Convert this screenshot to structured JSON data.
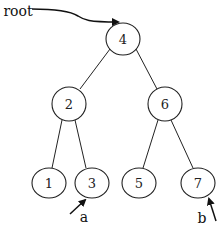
{
  "diagram": {
    "type": "binary-search-tree",
    "nodes": [
      {
        "id": "n4",
        "label": "4"
      },
      {
        "id": "n2",
        "label": "2"
      },
      {
        "id": "n6",
        "label": "6"
      },
      {
        "id": "n1",
        "label": "1"
      },
      {
        "id": "n3",
        "label": "3"
      },
      {
        "id": "n5",
        "label": "5"
      },
      {
        "id": "n7",
        "label": "7"
      }
    ],
    "edges": [
      {
        "from": "n4",
        "to": "n2"
      },
      {
        "from": "n4",
        "to": "n6"
      },
      {
        "from": "n2",
        "to": "n1"
      },
      {
        "from": "n2",
        "to": "n3"
      },
      {
        "from": "n6",
        "to": "n5"
      },
      {
        "from": "n6",
        "to": "n7"
      }
    ],
    "pointers": [
      {
        "label": "root",
        "target": "n4"
      },
      {
        "label": "a",
        "target": "n3"
      },
      {
        "label": "b",
        "target": "n7"
      }
    ]
  }
}
